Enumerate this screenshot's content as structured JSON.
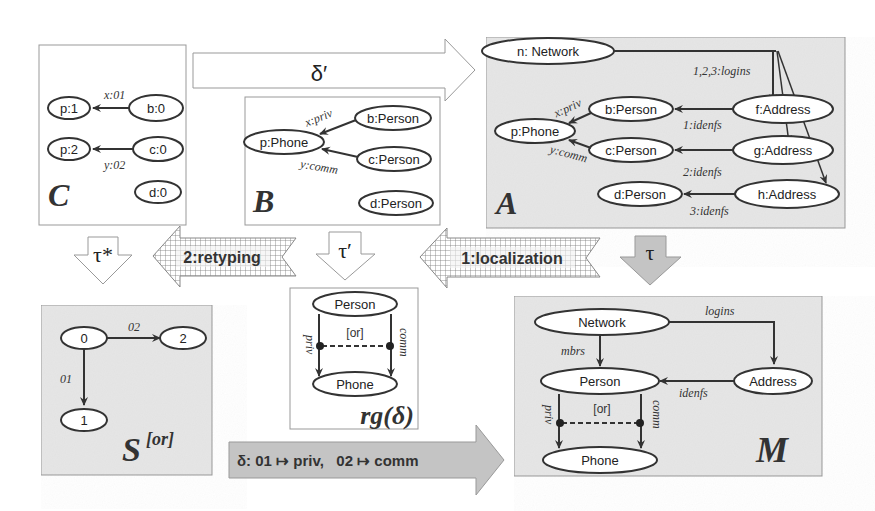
{
  "colors": {
    "gray_panel": "#e6e6e6",
    "white_panel": "#ffffff",
    "border": "#9a9a9a",
    "stroke": "#333333",
    "gray_arrow": "#c4c4c4"
  },
  "panels": {
    "C": {
      "title": "C",
      "nodes": [
        "p:1",
        "b:0",
        "p:2",
        "c:0",
        "d:0"
      ],
      "edges": [
        {
          "from": "b:0",
          "to": "p:1",
          "label": "x:01"
        },
        {
          "from": "c:0",
          "to": "p:2",
          "label": "y:02"
        }
      ]
    },
    "B": {
      "title": "B",
      "nodes": [
        "p:Phone",
        "b:Person",
        "c:Person",
        "d:Person"
      ],
      "edges": [
        {
          "from": "b:Person",
          "to": "p:Phone",
          "label": "x:priv"
        },
        {
          "from": "c:Person",
          "to": "p:Phone",
          "label": "y:comm"
        }
      ]
    },
    "A": {
      "title": "A",
      "nodes": [
        "n: Network",
        "b:Person",
        "f:Address",
        "p:Phone",
        "c:Person",
        "g:Address",
        "d:Person",
        "h:Address"
      ],
      "edges": [
        {
          "from": "n: Network",
          "to": "f:Address",
          "label": "1,2,3:logins"
        },
        {
          "from": "n: Network",
          "to": "g:Address",
          "label": ""
        },
        {
          "from": "n: Network",
          "to": "h:Address",
          "label": ""
        },
        {
          "from": "f:Address",
          "to": "b:Person",
          "label": "1:idenfs"
        },
        {
          "from": "g:Address",
          "to": "c:Person",
          "label": "2:idenfs"
        },
        {
          "from": "h:Address",
          "to": "d:Person",
          "label": "3:idenfs"
        },
        {
          "from": "b:Person",
          "to": "p:Phone",
          "label": "x:priv"
        },
        {
          "from": "c:Person",
          "to": "p:Phone",
          "label": "y:comm"
        }
      ]
    },
    "S": {
      "title": "S",
      "superscript": "[or]",
      "nodes": [
        "0",
        "2",
        "1"
      ],
      "edges": [
        {
          "from": "0",
          "to": "2",
          "label": "02"
        },
        {
          "from": "0",
          "to": "1",
          "label": "01"
        }
      ]
    },
    "rg": {
      "title": "rg(δ)",
      "nodes": [
        "Person",
        "Phone"
      ],
      "edges": [
        {
          "from": "Person",
          "to": "Phone",
          "label": "priv"
        },
        {
          "from": "Person",
          "to": "Phone",
          "label": "comm"
        }
      ],
      "constraint": "[or]"
    },
    "M": {
      "title": "M",
      "nodes": [
        "Network",
        "Person",
        "Address",
        "Phone"
      ],
      "edges": [
        {
          "from": "Network",
          "to": "Address",
          "label": "logins"
        },
        {
          "from": "Network",
          "to": "Person",
          "label": "mbrs"
        },
        {
          "from": "Address",
          "to": "Person",
          "label": "idenfs"
        },
        {
          "from": "Person",
          "to": "Phone",
          "label": "priv"
        },
        {
          "from": "Person",
          "to": "Phone",
          "label": "comm"
        }
      ],
      "constraint": "[or]"
    }
  },
  "arrows": {
    "delta_prime": "δ′",
    "tau_star": "τ*",
    "retyping": "2:retyping",
    "tau_prime": "τ′",
    "localization": "1:localization",
    "tau": "τ",
    "delta": "δ: 01 ↦ priv,   02 ↦ comm"
  }
}
